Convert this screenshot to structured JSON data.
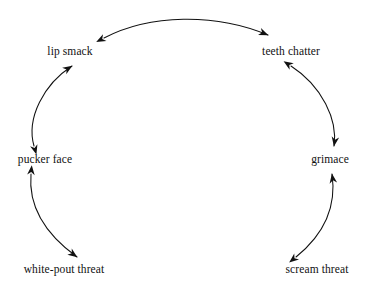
{
  "diagram": {
    "type": "cycle-flow-diagram",
    "title": "",
    "background_color": "#ffffff",
    "line_color": "#111111",
    "text_color": "#111111",
    "shape": "open circular arc (C-shape, open at bottom)",
    "nodes": [
      {
        "id": "lip-smack",
        "label": "lip smack",
        "x": 70,
        "y": 52
      },
      {
        "id": "teeth-chatter",
        "label": "teeth chatter",
        "x": 291,
        "y": 52
      },
      {
        "id": "pucker-face",
        "label": "pucker face",
        "x": 45,
        "y": 160
      },
      {
        "id": "grimace",
        "label": "grimace",
        "x": 330,
        "y": 160
      },
      {
        "id": "white-pout-threat",
        "label": "white-pout threat",
        "x": 64,
        "y": 270
      },
      {
        "id": "scream-threat",
        "label": "scream threat",
        "x": 317,
        "y": 270
      }
    ],
    "edges": [
      {
        "id": "edge-lip-smack-teeth-chatter",
        "from": "lip smack",
        "to": "teeth chatter",
        "arrowheads": "both",
        "curve": "arc bowing upward",
        "path": "M 104 38 C 150 14 215 13 268 35"
      },
      {
        "id": "edge-pucker-face-lip-smack",
        "from": "pucker face",
        "to": "lip smack",
        "arrowheads": "both",
        "curve": "arc bowing left",
        "path": "M 34 146 C 26 118 44 84 72 66"
      },
      {
        "id": "edge-teeth-chatter-grimace",
        "from": "teeth chatter",
        "to": "grimace",
        "arrowheads": "both",
        "curve": "arc bowing right",
        "path": "M 291 66 C 322 86 338 120 334 146"
      },
      {
        "id": "edge-white-pout-threat-pucker-face",
        "from": "white-pout threat",
        "to": "pucker face",
        "arrowheads": "both",
        "curve": "arc bowing left",
        "path": "M 31 174 C 28 208 48 236 77 257"
      },
      {
        "id": "edge-scream-threat-grimace",
        "from": "scream threat",
        "to": "grimace",
        "arrowheads": "both",
        "curve": "arc bowing right",
        "path": "M 296 257 C 322 236 337 208 332 174"
      }
    ]
  }
}
